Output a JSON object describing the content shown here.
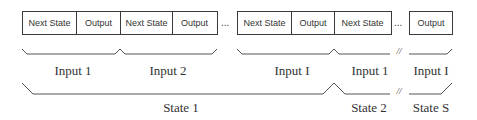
{
  "cells": [
    {
      "label": "Next State"
    },
    {
      "label": "Output"
    },
    {
      "label": "Next State"
    },
    {
      "label": "Output"
    },
    {
      "label": "Next State"
    },
    {
      "label": "Output"
    },
    {
      "label": "Next State"
    },
    {
      "label": "Output"
    }
  ],
  "ellipsis": "...",
  "inputs": [
    "Input 1",
    "Input 2",
    "Input I",
    "Input 1",
    "Input I"
  ],
  "states": [
    "State 1",
    "State 2",
    "State S"
  ],
  "break_mark": "//"
}
